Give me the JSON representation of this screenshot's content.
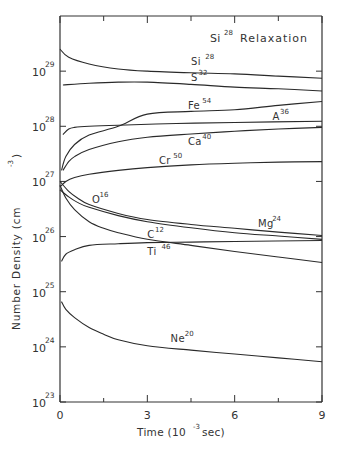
{
  "chart_data": {
    "type": "line",
    "title_base": "Si",
    "title_sup": "28",
    "title_rest": "Relaxation",
    "xlabel": "Time (10^-3 sec)",
    "xlabel_parts": {
      "pre": "Time (10",
      "sup": "-3",
      "post": " sec)"
    },
    "ylabel": "Number Density (cm^-3)",
    "ylabel_parts": {
      "pre": "Number Density (cm",
      "sup": "-3",
      "post": ")"
    },
    "xlim": [
      0,
      9
    ],
    "ylim_log10": [
      23,
      30
    ],
    "yscale": "log",
    "x_ticks": [
      0,
      3,
      6,
      9
    ],
    "x_tick_labels": [
      "0",
      "3",
      "6",
      "9"
    ],
    "x_minor_ticks": [
      1.5,
      4.5,
      7.5
    ],
    "y_ticks_log10": [
      23,
      24,
      25,
      26,
      27,
      28,
      29
    ],
    "y_tick_labels": [
      {
        "base": "10",
        "exp": "23"
      },
      {
        "base": "10",
        "exp": "24"
      },
      {
        "base": "10",
        "exp": "25"
      },
      {
        "base": "10",
        "exp": "26"
      },
      {
        "base": "10",
        "exp": "27"
      },
      {
        "base": "10",
        "exp": "28"
      },
      {
        "base": "10",
        "exp": "29"
      }
    ],
    "grid": false,
    "legend": "inline labels",
    "series": [
      {
        "name": "Si28",
        "base": "Si",
        "mass": "28",
        "label_at": [
          4.5,
          29.12
        ],
        "x": [
          0,
          0.3,
          1,
          2,
          3,
          4.5,
          6,
          7.5,
          9
        ],
        "log10_values": [
          29.4,
          29.25,
          29.13,
          29.04,
          29.0,
          28.97,
          28.95,
          28.91,
          28.87
        ]
      },
      {
        "name": "S32",
        "base": "S",
        "mass": "32",
        "label_at": [
          4.5,
          28.82
        ],
        "x": [
          0.1,
          1,
          2,
          3,
          4.5,
          6,
          7.5,
          9
        ],
        "log10_values": [
          28.75,
          28.78,
          28.8,
          28.8,
          28.76,
          28.71,
          28.68,
          28.64
        ]
      },
      {
        "name": "Fe54",
        "base": "Fe",
        "mass": "54",
        "label_at": [
          4.4,
          28.32
        ],
        "x": [
          0.05,
          0.2,
          0.5,
          1,
          2,
          3,
          4.5,
          6,
          7.5,
          9
        ],
        "log10_values": [
          27.2,
          27.45,
          27.67,
          27.84,
          28.0,
          28.22,
          28.27,
          28.3,
          28.38,
          28.45
        ]
      },
      {
        "name": "A36",
        "base": "A",
        "mass": "36",
        "label_at": [
          7.3,
          28.12
        ],
        "x": [
          0.1,
          0.3,
          0.5,
          1,
          2,
          4,
          6,
          9
        ],
        "log10_values": [
          27.85,
          27.95,
          27.98,
          28.0,
          28.02,
          28.05,
          28.07,
          28.09
        ]
      },
      {
        "name": "Ca40",
        "base": "Ca",
        "mass": "40",
        "label_at": [
          4.4,
          27.66
        ],
        "x": [
          0.1,
          0.3,
          0.5,
          1,
          2,
          3,
          4.5,
          6,
          7.5,
          9
        ],
        "log10_values": [
          27.2,
          27.36,
          27.45,
          27.58,
          27.72,
          27.8,
          27.86,
          27.91,
          27.95,
          27.98
        ]
      },
      {
        "name": "Cr50",
        "base": "Cr",
        "mass": "50",
        "label_at": [
          3.4,
          27.32
        ],
        "x": [
          0,
          0.2,
          0.5,
          1,
          2,
          3,
          4.5,
          6,
          7.5,
          9
        ],
        "log10_values": [
          26.9,
          27.0,
          27.07,
          27.13,
          27.2,
          27.25,
          27.3,
          27.33,
          27.35,
          27.36
        ]
      },
      {
        "name": "O16",
        "base": "O",
        "mass": "16",
        "label_at": [
          1.1,
          26.6
        ],
        "x": [
          0,
          0.3,
          0.6,
          1,
          2,
          3,
          4.5,
          6,
          7.5,
          9
        ],
        "log10_values": [
          27.0,
          26.82,
          26.7,
          26.58,
          26.42,
          26.31,
          26.22,
          26.15,
          26.08,
          26.02
        ]
      },
      {
        "name": "Mg24",
        "base": "Mg",
        "mass": "24",
        "label_at": [
          6.8,
          26.18
        ],
        "x": [
          0,
          0.3,
          0.6,
          1,
          2,
          3,
          4.5,
          6,
          7.5,
          9
        ],
        "log10_values": [
          26.85,
          26.72,
          26.62,
          26.53,
          26.38,
          26.27,
          26.16,
          26.07,
          26.01,
          25.95
        ]
      },
      {
        "name": "C12",
        "base": "C",
        "mass": "12",
        "label_at": [
          3.0,
          25.98
        ],
        "x": [
          0,
          0.2,
          0.5,
          1,
          1.5,
          2,
          3,
          4.5,
          6,
          7.5,
          9
        ],
        "log10_values": [
          26.93,
          26.7,
          26.49,
          26.27,
          26.15,
          26.07,
          25.95,
          25.84,
          25.73,
          25.63,
          25.53
        ]
      },
      {
        "name": "Ti46",
        "base": "Ti",
        "mass": "46",
        "label_at": [
          3.0,
          25.66
        ],
        "x": [
          0.05,
          0.2,
          0.5,
          1,
          2,
          3,
          4.5,
          6,
          9
        ],
        "log10_values": [
          25.55,
          25.68,
          25.76,
          25.84,
          25.87,
          25.89,
          25.9,
          25.91,
          25.93
        ]
      },
      {
        "name": "Ne20",
        "base": "Ne",
        "mass": "20",
        "label_at": [
          3.8,
          24.08
        ],
        "x": [
          0.05,
          0.2,
          0.5,
          1,
          1.5,
          2,
          3,
          4.5,
          6,
          7.5,
          9
        ],
        "log10_values": [
          24.82,
          24.68,
          24.53,
          24.35,
          24.23,
          24.13,
          24.02,
          23.94,
          23.87,
          23.8,
          23.73
        ]
      }
    ]
  }
}
